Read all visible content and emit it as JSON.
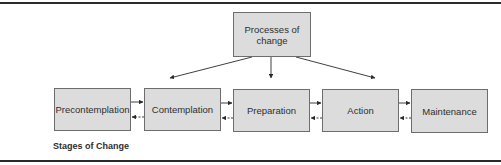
{
  "diagram": {
    "type": "flow",
    "top_node": {
      "label": "Processes of change"
    },
    "stages": [
      {
        "label": "Precontemplation"
      },
      {
        "label": "Contemplation"
      },
      {
        "label": "Preparation"
      },
      {
        "label": "Action"
      },
      {
        "label": "Maintenance"
      }
    ],
    "caption": "Stages of Change",
    "edges": [
      {
        "from": "Processes of change",
        "to": "Contemplation",
        "style": "solid"
      },
      {
        "from": "Processes of change",
        "to": "Preparation",
        "style": "solid"
      },
      {
        "from": "Processes of change",
        "to": "Action",
        "style": "solid"
      },
      {
        "from": "Precontemplation",
        "to": "Contemplation",
        "style": "solid"
      },
      {
        "from": "Contemplation",
        "to": "Precontemplation",
        "style": "dashed"
      },
      {
        "from": "Contemplation",
        "to": "Preparation",
        "style": "solid"
      },
      {
        "from": "Preparation",
        "to": "Contemplation",
        "style": "dashed"
      },
      {
        "from": "Preparation",
        "to": "Action",
        "style": "solid"
      },
      {
        "from": "Action",
        "to": "Preparation",
        "style": "dashed"
      },
      {
        "from": "Action",
        "to": "Maintenance",
        "style": "solid"
      },
      {
        "from": "Maintenance",
        "to": "Action",
        "style": "dashed"
      }
    ]
  }
}
